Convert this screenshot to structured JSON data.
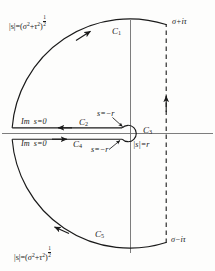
{
  "figure": {
    "kind": "bromwich-contour",
    "background_color": "#fdfdfc",
    "ink_color": "#1a1a1a"
  },
  "axes": {
    "real_axis_name": "real-axis",
    "imaginary_axis_name": "imaginary-axis",
    "origin": {
      "x": 130,
      "y": 133
    }
  },
  "labels": {
    "modulus_top": {
      "magnitude": "|s|",
      "equals": "=",
      "expr_open": "(",
      "sigma": "σ",
      "sigma_exp": "2",
      "plus": "+",
      "tau": "τ",
      "tau_exp": "2",
      "expr_close": ")",
      "power_num": "1",
      "power_den": "2"
    },
    "modulus_bottom": {
      "magnitude": "|s|",
      "equals": "=",
      "expr_open": "(",
      "sigma": "σ",
      "sigma_exp": "2",
      "plus": "+",
      "tau": "τ",
      "tau_exp": "2",
      "expr_close": ")",
      "power_num": "1",
      "power_den": "2"
    },
    "corner_top_right": "σ+iτ",
    "corner_bottom_right": "σ−iτ",
    "small_circle_radius": "|s|=r",
    "branch_point_upper": "s=−r",
    "branch_point_lower": "s=−r",
    "im_zero_upper": {
      "im": "Im",
      "value": "s=0"
    },
    "im_zero_lower": {
      "im": "Im",
      "value": "s=0"
    }
  },
  "contour_segments": [
    {
      "id": "C1",
      "letter": "C",
      "index": "1",
      "description": "upper large circular arc",
      "direction": "counterclockwise"
    },
    {
      "id": "C2",
      "letter": "C",
      "index": "2",
      "description": "upper side of branch cut, leftward",
      "direction": "leftward"
    },
    {
      "id": "C3",
      "letter": "C",
      "index": "3",
      "description": "small circle about the branch point at origin",
      "direction": "clockwise-around-origin"
    },
    {
      "id": "C4",
      "letter": "C",
      "index": "4",
      "description": "lower side of branch cut, rightward",
      "direction": "rightward"
    },
    {
      "id": "C5",
      "letter": "C",
      "index": "5",
      "description": "lower large circular arc",
      "direction": "counterclockwise"
    }
  ],
  "geometry": {
    "big_arc_center_x": 130,
    "big_arc_center_y": 133,
    "big_arc_radius": 118,
    "small_circle_radius_px": 8,
    "dashed_line_x": 166,
    "dashed_top_y": 24,
    "dashed_bottom_y": 243
  },
  "dashed_line": {
    "name": "bromwich-vertical-path",
    "style": "dashed",
    "direction": "upward"
  }
}
